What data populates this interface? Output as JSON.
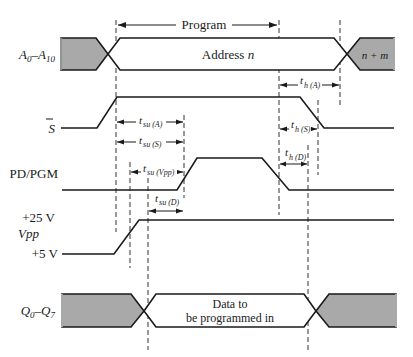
{
  "diagram": {
    "program_label": "Program",
    "signals": [
      {
        "id": "address",
        "label_main": "A",
        "label_sub1": "0",
        "label_dash": "–",
        "label_main2": "A",
        "label_sub2": "10"
      },
      {
        "id": "s_bar",
        "label_main": "S"
      },
      {
        "id": "pd_pgm",
        "label_main": "PD/PGM"
      },
      {
        "id": "vpp",
        "label_main": "Vpp",
        "level_high": "+25 V",
        "level_low": "+5 V"
      },
      {
        "id": "data",
        "label_main": "Q",
        "label_sub1": "0",
        "label_dash": "–",
        "label_main2": "Q",
        "label_sub2": "7"
      }
    ],
    "bus_text": {
      "address_n": "Address n",
      "address_n_main": "Address ",
      "address_n_var": "n",
      "address_next": "n + m",
      "data_line1": "Data to",
      "data_line2": "be programmed in"
    },
    "timing_params": [
      {
        "id": "tsu_A",
        "t": "t",
        "sub": "su (A)"
      },
      {
        "id": "tsu_S",
        "t": "t",
        "sub": "su (S)"
      },
      {
        "id": "tsu_Vpp",
        "t": "t",
        "sub": "su (Vpp)"
      },
      {
        "id": "tsu_D",
        "t": "t",
        "sub": "su (D)"
      },
      {
        "id": "th_A",
        "t": "t",
        "sub": "h (A)"
      },
      {
        "id": "th_S",
        "t": "t",
        "sub": "h (S)"
      },
      {
        "id": "th_D",
        "t": "t",
        "sub": "h (D)"
      }
    ],
    "colors": {
      "line": "#1a1a1a",
      "bus_invalid_fill": "#a9a9a9",
      "background": "#ffffff"
    }
  }
}
